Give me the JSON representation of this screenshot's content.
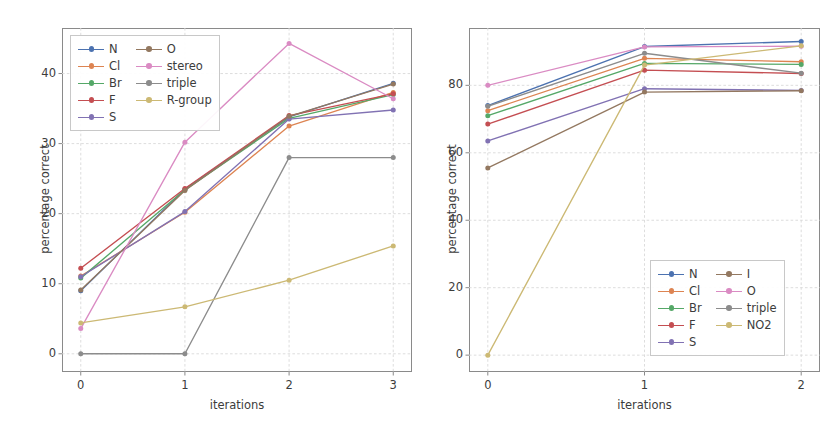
{
  "figure": {
    "width": 833,
    "height": 445,
    "background": "#ffffff",
    "axis_color": "#8a8a8a",
    "grid_color": "#d9d9d9",
    "text_color": "#3c3c3c"
  },
  "chart_data": [
    {
      "id": "left",
      "type": "line",
      "title": "",
      "xlabel": "iterations",
      "ylabel": "percentage correct",
      "x": [
        0,
        1,
        2,
        3
      ],
      "xticks": [
        "0",
        "1",
        "2",
        "3"
      ],
      "yticks": [
        "0",
        "10",
        "20",
        "30",
        "40"
      ],
      "ytick_values": [
        0,
        10,
        20,
        30,
        40
      ],
      "xlim": [
        -0.18,
        3.18
      ],
      "ylim": [
        -2.6,
        46.5
      ],
      "grid": true,
      "legend_position": "upper left",
      "legend_ncol": 2,
      "series": [
        {
          "name": "N",
          "color": "#4c72b0",
          "values": [
            9.0,
            23.5,
            33.8,
            38.6
          ]
        },
        {
          "name": "Cl",
          "color": "#dd8452",
          "values": [
            11.1,
            20.2,
            32.5,
            37.3
          ]
        },
        {
          "name": "Br",
          "color": "#55a868",
          "values": [
            10.8,
            23.4,
            33.6,
            37.0
          ]
        },
        {
          "name": "F",
          "color": "#c44e52",
          "values": [
            12.2,
            23.6,
            34.0,
            37.1
          ]
        },
        {
          "name": "S",
          "color": "#8172b3",
          "values": [
            11.0,
            20.3,
            33.5,
            34.8
          ]
        },
        {
          "name": "O",
          "color": "#937860",
          "values": [
            9.1,
            23.3,
            33.9,
            38.5
          ]
        },
        {
          "name": "stereo",
          "color": "#da8bc3",
          "values": [
            3.6,
            30.2,
            44.3,
            36.4
          ]
        },
        {
          "name": "triple",
          "color": "#8c8c8c",
          "values": [
            0.0,
            0.0,
            28.0,
            28.0
          ]
        },
        {
          "name": "R-group",
          "color": "#ccb974",
          "values": [
            4.4,
            6.7,
            10.5,
            15.4
          ]
        }
      ]
    },
    {
      "id": "right",
      "type": "line",
      "title": "",
      "xlabel": "iterations",
      "ylabel": "percentage correct",
      "x": [
        0,
        1,
        2
      ],
      "xticks": [
        "0",
        "1",
        "2"
      ],
      "yticks": [
        "0",
        "20",
        "40",
        "60",
        "80"
      ],
      "ytick_values": [
        0,
        20,
        40,
        60,
        80
      ],
      "xlim": [
        -0.12,
        2.12
      ],
      "ylim": [
        -5.0,
        97.0
      ],
      "grid": true,
      "legend_position": "lower right",
      "legend_ncol": 2,
      "series": [
        {
          "name": "N",
          "color": "#4c72b0",
          "values": [
            74.0,
            91.5,
            93.0
          ]
        },
        {
          "name": "Cl",
          "color": "#dd8452",
          "values": [
            72.5,
            88.0,
            87.0
          ]
        },
        {
          "name": "Br",
          "color": "#55a868",
          "values": [
            71.0,
            86.5,
            86.2
          ]
        },
        {
          "name": "F",
          "color": "#c44e52",
          "values": [
            68.5,
            84.5,
            83.5
          ]
        },
        {
          "name": "S",
          "color": "#8172b3",
          "values": [
            63.5,
            79.0,
            78.5
          ]
        },
        {
          "name": "I",
          "color": "#937860",
          "values": [
            55.5,
            78.0,
            78.4
          ]
        },
        {
          "name": "O",
          "color": "#da8bc3",
          "values": [
            80.0,
            91.4,
            91.6
          ]
        },
        {
          "name": "triple",
          "color": "#8c8c8c",
          "values": [
            73.8,
            89.5,
            83.6
          ]
        },
        {
          "name": "NO2",
          "color": "#ccb974",
          "values": [
            0.0,
            86.0,
            91.7
          ]
        }
      ]
    }
  ]
}
